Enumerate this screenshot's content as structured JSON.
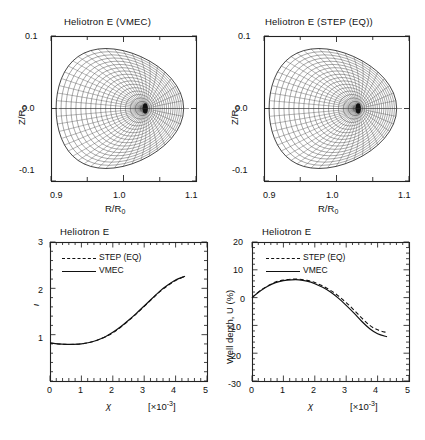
{
  "figure": {
    "kind": "multi-panel-scientific-figure",
    "background": "#ffffff",
    "ink": "#111111"
  },
  "panels": {
    "flux_vmec": {
      "title": "Heliotron E (VMEC)",
      "xlabel": "R/R",
      "xlabel_sub": "0",
      "ylabel": "Z/R",
      "ylabel_sub": "0",
      "xticks": [
        "0.9",
        "1.0",
        "1.1"
      ],
      "yticks": [
        "0.1",
        "0.0",
        "-0.1"
      ]
    },
    "flux_step": {
      "title": "Heliotron E (STEP (EQ))",
      "xlabel": "R/R",
      "xlabel_sub": "0",
      "ylabel": "Z/R",
      "ylabel_sub": "0",
      "xticks": [
        "0.9",
        "1.0",
        "1.1"
      ],
      "yticks": [
        "0.1",
        "0.0",
        "-0.1"
      ]
    },
    "iota": {
      "title": "Heliotron E",
      "ylabel": "ι",
      "xlabel": "χ",
      "xunits_open": "[×10",
      "xunits_exp": "-3",
      "xunits_close": "]",
      "xticks": [
        "0",
        "1",
        "2",
        "3",
        "4",
        "5"
      ],
      "yticks": [
        "1",
        "2",
        "3"
      ],
      "legend": [
        {
          "label": "STEP (EQ)",
          "style": "dashed"
        },
        {
          "label": "VMEC",
          "style": "solid"
        }
      ]
    },
    "well": {
      "title": "Heliotron E",
      "ylabel": "Well depth, U (%)",
      "xlabel": "χ",
      "xunits_open": "[×10",
      "xunits_exp": "-3",
      "xunits_close": "]",
      "xticks": [
        "0",
        "1",
        "2",
        "3",
        "4",
        "5"
      ],
      "yticks": [
        "20",
        "10",
        "0",
        "-10",
        "-20",
        "-30"
      ],
      "legend": [
        {
          "label": "STEP (EQ)",
          "style": "dashed"
        },
        {
          "label": "VMEC",
          "style": "solid"
        }
      ]
    }
  },
  "chart_data": [
    {
      "id": "flux_vmec",
      "type": "line",
      "title": "Heliotron E (VMEC)",
      "xlabel": "R/R0",
      "ylabel": "Z/R0",
      "xlim": [
        0.9,
        1.1
      ],
      "ylim": [
        -0.1,
        0.1
      ],
      "xticks": [
        0.9,
        1.0,
        1.1
      ],
      "yticks": [
        -0.1,
        0.0,
        0.1
      ],
      "grid": false,
      "description": "Nested magnetic flux surfaces of Heliotron E computed by VMEC, plotted as poloidal cross-section with radial mesh lines converging at the magnetic axis near R/R0 = 1.03.",
      "boundary": {
        "center_x": 0.995,
        "center_y": 0.0,
        "radius_x": 0.088,
        "radius_y": 0.088
      },
      "magnetic_axis": {
        "x": 1.03,
        "y": 0.0
      },
      "n_flux_surfaces": 18,
      "n_poloidal_rays": 48
    },
    {
      "id": "flux_step",
      "type": "line",
      "title": "Heliotron E (STEP (EQ))",
      "xlabel": "R/R0",
      "ylabel": "Z/R0",
      "xlim": [
        0.9,
        1.1
      ],
      "ylim": [
        -0.1,
        0.1
      ],
      "xticks": [
        0.9,
        1.0,
        1.1
      ],
      "yticks": [
        -0.1,
        0.0,
        0.1
      ],
      "grid": false,
      "description": "Nested magnetic flux surfaces of Heliotron E computed by STEP (EQ), nearly identical to the VMEC result.",
      "boundary": {
        "center_x": 0.995,
        "center_y": 0.0,
        "radius_x": 0.088,
        "radius_y": 0.088
      },
      "magnetic_axis": {
        "x": 1.03,
        "y": 0.0
      },
      "n_flux_surfaces": 18,
      "n_poloidal_rays": 48
    },
    {
      "id": "iota",
      "type": "line",
      "title": "Heliotron E",
      "xlabel": "χ [×10^-3]",
      "ylabel": "ι",
      "xlim": [
        0,
        5
      ],
      "ylim": [
        0,
        3
      ],
      "xticks": [
        0,
        1,
        2,
        3,
        4,
        5
      ],
      "yticks": [
        1,
        2,
        3
      ],
      "minor_tick_interval_x": 0.2,
      "minor_tick_interval_y": 0.2,
      "grid": false,
      "legend_position": "upper-left",
      "x": [
        0.0,
        0.25,
        0.5,
        0.75,
        1.0,
        1.25,
        1.5,
        1.75,
        2.0,
        2.25,
        2.5,
        2.75,
        3.0,
        3.25,
        3.5,
        3.75,
        4.0,
        4.3
      ],
      "series": [
        {
          "name": "STEP (EQ)",
          "style": "dashed",
          "values": [
            0.82,
            0.8,
            0.79,
            0.79,
            0.8,
            0.83,
            0.88,
            0.95,
            1.04,
            1.16,
            1.3,
            1.45,
            1.61,
            1.77,
            1.93,
            2.06,
            2.17,
            2.26
          ]
        },
        {
          "name": "VMEC",
          "style": "solid",
          "values": [
            0.82,
            0.8,
            0.79,
            0.79,
            0.8,
            0.83,
            0.88,
            0.95,
            1.05,
            1.17,
            1.31,
            1.46,
            1.62,
            1.78,
            1.94,
            2.07,
            2.18,
            2.26
          ]
        }
      ]
    },
    {
      "id": "well",
      "type": "line",
      "title": "Heliotron E",
      "xlabel": "χ [×10^-3]",
      "ylabel": "Well depth, U (%)",
      "xlim": [
        0,
        5
      ],
      "ylim": [
        -30,
        20
      ],
      "xticks": [
        0,
        1,
        2,
        3,
        4,
        5
      ],
      "yticks": [
        -30,
        -20,
        -10,
        0,
        10,
        20
      ],
      "minor_tick_interval_x": 0.2,
      "minor_tick_interval_y": 2,
      "grid": false,
      "legend_position": "upper-left",
      "x": [
        0.0,
        0.25,
        0.5,
        0.75,
        1.0,
        1.25,
        1.5,
        1.75,
        2.0,
        2.25,
        2.5,
        2.75,
        3.0,
        3.25,
        3.5,
        3.75,
        4.0,
        4.3
      ],
      "series": [
        {
          "name": "STEP (EQ)",
          "style": "dashed",
          "values": [
            0.0,
            2.4,
            4.2,
            5.6,
            6.3,
            6.6,
            6.6,
            6.2,
            5.4,
            4.2,
            2.6,
            0.6,
            -1.8,
            -4.5,
            -7.4,
            -10.0,
            -11.6,
            -12.6
          ]
        },
        {
          "name": "VMEC",
          "style": "solid",
          "values": [
            0.0,
            2.3,
            4.1,
            5.4,
            6.1,
            6.4,
            6.4,
            5.9,
            5.0,
            3.7,
            2.0,
            -0.2,
            -2.8,
            -5.6,
            -8.6,
            -11.2,
            -13.0,
            -14.1
          ]
        }
      ]
    }
  ]
}
